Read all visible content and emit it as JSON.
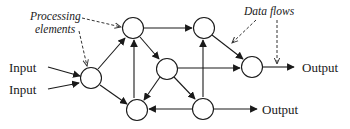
{
  "diagram": {
    "labels": {
      "input_1": "Input",
      "input_2": "Input",
      "output_1": "Output",
      "output_2": "Output",
      "annotation_processing_line1": "Processing",
      "annotation_processing_line2": "elements",
      "annotation_dataflows": "Data flows"
    },
    "nodes": [
      {
        "id": "A",
        "role": "input-node"
      },
      {
        "id": "B",
        "role": "hidden-top-left"
      },
      {
        "id": "C",
        "role": "hidden-middle"
      },
      {
        "id": "D",
        "role": "hidden-bottom-left"
      },
      {
        "id": "E",
        "role": "hidden-bottom-right"
      },
      {
        "id": "F",
        "role": "hidden-top-right"
      },
      {
        "id": "G",
        "role": "output-node"
      }
    ],
    "edges": [
      {
        "from": "Input",
        "to": "A"
      },
      {
        "from": "Input",
        "to": "A"
      },
      {
        "from": "A",
        "to": "B"
      },
      {
        "from": "A",
        "to": "D"
      },
      {
        "from": "D",
        "to": "B"
      },
      {
        "from": "B",
        "to": "F"
      },
      {
        "from": "B",
        "to": "C"
      },
      {
        "from": "C",
        "to": "D"
      },
      {
        "from": "C",
        "to": "E"
      },
      {
        "from": "C",
        "to": "G"
      },
      {
        "from": "E",
        "to": "D"
      },
      {
        "from": "E",
        "to": "F"
      },
      {
        "from": "F",
        "to": "G"
      },
      {
        "from": "G",
        "to": "Output"
      },
      {
        "from": "E",
        "to": "Output"
      }
    ],
    "colors": {
      "stroke": "#1a1a1a",
      "background": "#ffffff"
    }
  }
}
